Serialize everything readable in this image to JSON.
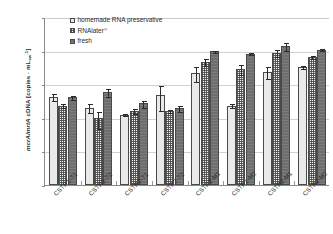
{
  "chart_data": {
    "type": "bar",
    "title": "",
    "xlabel": "",
    "ylabel": "mcrA/mrtA cDNA [copies · mL_sw^-1]",
    "ylabel_parts": {
      "italic": "mcrA/mrtA",
      "rest": " cDNA [copies · mL",
      "sub": "sw",
      "sup": "-1",
      "tail": "]"
    },
    "scale": "log",
    "ylim": [
      1000,
      100000000
    ],
    "yticks": [
      1000,
      10000,
      100000,
      1000000,
      10000000,
      100000000
    ],
    "ytick_labels": [
      "1.E+03",
      "1.E+04",
      "1.E+05",
      "1.E+06",
      "1.E+07",
      "1.E+08"
    ],
    "grid": true,
    "legend_position": "top-left",
    "categories": [
      "CSTR1-T1",
      "CSTR1-T2",
      "CSTR2-T1",
      "CSTR2-T2",
      "CSTR1-M1",
      "CSTR1-M2",
      "CSTR2-M1",
      "CSTR2-M2"
    ],
    "series": [
      {
        "name": "homemade RNA preservative",
        "fill": "light-gray-fine-lines",
        "values": [
          420000.0,
          200000.0,
          125000.0,
          480000.0,
          2200000.0,
          230000.0,
          2300000.0,
          3300000.0
        ],
        "err_low": [
          100000.0,
          60000.0,
          15000.0,
          320000.0,
          1000000.0,
          35000.0,
          900000.0,
          400000.0
        ],
        "err_high": [
          130000.0,
          70000.0,
          18000.0,
          450000.0,
          1400000.0,
          40000.0,
          1200000.0,
          450000.0
        ]
      },
      {
        "name": "RNAlater®",
        "fill": "checkered",
        "values": [
          230000.0,
          98000.0,
          160000.0,
          160000.0,
          4600000.0,
          2800000.0,
          8500000.0,
          6500000.0
        ],
        "err_low": [
          40000.0,
          50000.0,
          30000.0,
          20000.0,
          1000000.0,
          900000.0,
          2000000.0,
          900000.0
        ],
        "err_high": [
          50000.0,
          60000.0,
          40000.0,
          25000.0,
          1400000.0,
          1200000.0,
          2600000.0,
          1100000.0
        ]
      },
      {
        "name": "fresh",
        "fill": "solid-dark-gray",
        "values": [
          410000.0,
          580000.0,
          270000.0,
          190000.0,
          9500000.0,
          8000000.0,
          13500000.0,
          10500000.0
        ],
        "err_low": [
          60000.0,
          160000.0,
          70000.0,
          40000.0,
          1000000.0,
          700000.0,
          3500000.0,
          1000000.0
        ],
        "err_high": [
          70000.0,
          190000.0,
          80000.0,
          50000.0,
          1200000.0,
          800000.0,
          4500000.0,
          1200000.0
        ]
      }
    ]
  },
  "legend": {
    "items": [
      {
        "label": "homemade RNA preservative",
        "sup": ""
      },
      {
        "label": "RNAlater",
        "sup": "®"
      },
      {
        "label": "fresh",
        "sup": ""
      }
    ]
  },
  "colors": {
    "series1": "#e9e9e9",
    "series2": "#f2f2f2",
    "series3": "#6e6e6e",
    "axis": "#8a8a8a",
    "grid": "#d2d2d2",
    "text": "#2b2b2b",
    "background": "#ffffff"
  }
}
